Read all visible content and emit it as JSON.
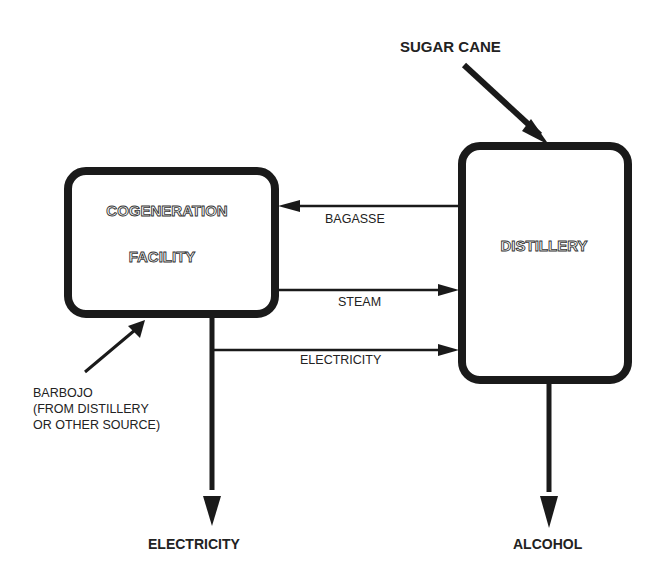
{
  "diagram": {
    "nodes": {
      "cogeneration": {
        "line1": "COGENERATION",
        "line2": "FACILITY"
      },
      "distillery": {
        "label": "DISTILLERY"
      }
    },
    "inputs": {
      "sugar_cane": "SUGAR CANE",
      "barbojo_line1": "BARBOJO",
      "barbojo_line2": "(FROM DISTILLERY",
      "barbojo_line3": "OR OTHER SOURCE)"
    },
    "flows": {
      "bagasse": "BAGASSE",
      "steam": "STEAM",
      "electricity_internal": "ELECTRICITY"
    },
    "outputs": {
      "electricity": "ELECTRICITY",
      "alcohol": "ALCOHOL"
    },
    "colors": {
      "stroke": "#1a1a1a",
      "text": "#222222",
      "background": "#ffffff"
    }
  }
}
